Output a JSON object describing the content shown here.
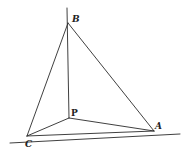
{
  "diagram": {
    "type": "geometric-figure",
    "stroke_color": "#2a2a2a",
    "points": {
      "B": {
        "label": "B",
        "x": 68,
        "y": 23
      },
      "P": {
        "label": "P",
        "x": 69,
        "y": 118
      },
      "C": {
        "label": "C",
        "x": 27,
        "y": 136
      },
      "A": {
        "label": "A",
        "x": 154,
        "y": 131
      }
    },
    "segments": [
      {
        "name": "BP-vertical",
        "from": [
          67,
          8
        ],
        "to": [
          69,
          118
        ]
      },
      {
        "name": "BC",
        "from": [
          68,
          23
        ],
        "to": [
          27,
          136
        ]
      },
      {
        "name": "BA",
        "from": [
          68,
          23
        ],
        "to": [
          154,
          131
        ]
      },
      {
        "name": "PC",
        "from": [
          69,
          118
        ],
        "to": [
          27,
          136
        ]
      },
      {
        "name": "PA",
        "from": [
          69,
          118
        ],
        "to": [
          154,
          131
        ]
      },
      {
        "name": "CA",
        "from": [
          27,
          136
        ],
        "to": [
          154,
          131
        ]
      },
      {
        "name": "baseline",
        "from": [
          10,
          143
        ],
        "to": [
          180,
          134
        ]
      }
    ]
  }
}
